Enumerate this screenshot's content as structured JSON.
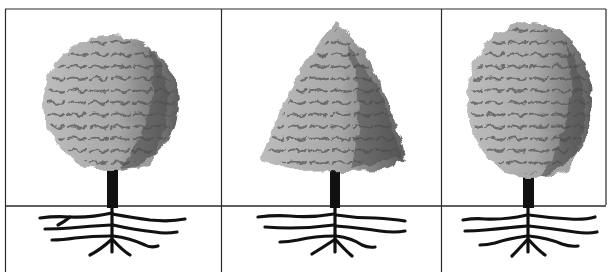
{
  "figure": {
    "panels": [
      {
        "id": "round",
        "shape": "round-crown-tree",
        "crown_shape": "round"
      },
      {
        "id": "conical",
        "shape": "conical-crown-tree",
        "crown_shape": "conical"
      },
      {
        "id": "oval",
        "shape": "oval-crown-tree",
        "crown_shape": "oval"
      }
    ],
    "colors": {
      "line": "#2a2a2a",
      "crown_light": "#b9b9b9",
      "crown_mid": "#8a8a8a",
      "crown_dark": "#4a4a4a",
      "trunk": "#111111",
      "background": "#ffffff"
    }
  }
}
